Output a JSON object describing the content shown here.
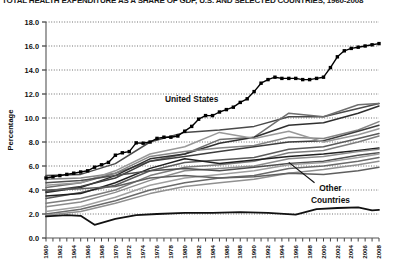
{
  "chart_data": {
    "type": "line",
    "title": "TOTAL HEALTH EXPENDITURE AS A SHARE OF GDP, U.S. AND SELECTED COUNTRIES, 1960-2008",
    "xlabel": "",
    "ylabel": "Percentage",
    "ylim": [
      0.0,
      18.0
    ],
    "ytick_step": 2.0,
    "yticks": [
      "0.0",
      "2.0",
      "4.0",
      "6.0",
      "8.0",
      "10.0",
      "12.0",
      "14.0",
      "16.0",
      "18.0"
    ],
    "xlim": [
      1960,
      2008
    ],
    "xticks": [
      "1960",
      "1962",
      "1964",
      "1966",
      "1968",
      "1970",
      "1972",
      "1974",
      "1976",
      "1978",
      "1980",
      "1982",
      "1984",
      "1986",
      "1988",
      "1990",
      "1992",
      "1994",
      "1996",
      "1998",
      "2000",
      "2002",
      "2004",
      "2006",
      "2008"
    ],
    "xtick_step": 2,
    "grid": "horizontal-dotted",
    "legend": "none",
    "annotations": [
      {
        "text": "United States",
        "x": 1981,
        "y": 11.3
      },
      {
        "text": "Other",
        "x": 2001,
        "y": 3.9
      },
      {
        "text": "Countries",
        "x": 2001,
        "y": 2.9
      }
    ],
    "series": [
      {
        "name": "United States",
        "emphasis": "marked",
        "color": "#000000",
        "marker": "square",
        "x": [
          1960,
          1961,
          1962,
          1963,
          1964,
          1965,
          1966,
          1967,
          1968,
          1969,
          1970,
          1971,
          1972,
          1973,
          1974,
          1975,
          1976,
          1977,
          1978,
          1979,
          1980,
          1981,
          1982,
          1983,
          1984,
          1985,
          1986,
          1987,
          1988,
          1989,
          1990,
          1991,
          1992,
          1993,
          1994,
          1995,
          1996,
          1997,
          1998,
          1999,
          2000,
          2001,
          2002,
          2003,
          2004,
          2005,
          2006,
          2007,
          2008
        ],
        "values": [
          5.0,
          5.1,
          5.2,
          5.3,
          5.4,
          5.5,
          5.6,
          5.9,
          6.1,
          6.3,
          6.9,
          7.1,
          7.2,
          7.927,
          7.9,
          8.0,
          8.3,
          8.4,
          8.4,
          8.5,
          8.9,
          9.3,
          9.9,
          10.2,
          10.2,
          10.5,
          10.7,
          10.9,
          11.3,
          11.6,
          12.2,
          12.9,
          13.2,
          13.4,
          13.3,
          13.3,
          13.3,
          13.2,
          13.2,
          13.3,
          13.4,
          14.2,
          15.1,
          15.6,
          15.8,
          15.9,
          16.0,
          16.1,
          16.2
        ]
      },
      {
        "name": "Other country A",
        "emphasis": "normal",
        "color": "#4a4a4a",
        "x": [
          1960,
          1965,
          1970,
          1975,
          1980,
          1985,
          1990,
          1995,
          2000,
          2005,
          2008
        ],
        "values": [
          5.2,
          5.3,
          6.2,
          8.0,
          8.8,
          9.0,
          9.3,
          10.1,
          10.1,
          10.8,
          11.2
        ]
      },
      {
        "name": "Other country B",
        "emphasis": "normal",
        "color": "#6e6e6e",
        "x": [
          1960,
          1965,
          1970,
          1975,
          1980,
          1985,
          1990,
          1995,
          2000,
          2005,
          2008
        ],
        "values": [
          4.2,
          4.6,
          5.4,
          6.4,
          7.0,
          8.2,
          8.4,
          10.4,
          10.1,
          11.1,
          11.2
        ]
      },
      {
        "name": "Other country C",
        "emphasis": "normal",
        "color": "#2f2f2f",
        "x": [
          1960,
          1965,
          1970,
          1975,
          1980,
          1985,
          1990,
          1995,
          2000,
          2005,
          2008
        ],
        "values": [
          3.8,
          4.2,
          5.2,
          6.6,
          7.0,
          7.9,
          8.4,
          9.4,
          9.6,
          10.4,
          11.0
        ]
      },
      {
        "name": "Other country D",
        "emphasis": "normal",
        "color": "#858585",
        "x": [
          1960,
          1965,
          1970,
          1975,
          1980,
          1985,
          1990,
          1995,
          2000,
          2005,
          2008
        ],
        "values": [
          4.9,
          5.0,
          5.4,
          6.8,
          7.2,
          7.5,
          7.7,
          8.4,
          8.3,
          9.0,
          9.7
        ]
      },
      {
        "name": "Other country E",
        "emphasis": "normal",
        "color": "#3d3d3d",
        "x": [
          1960,
          1965,
          1970,
          1975,
          1980,
          1985,
          1990,
          1995,
          2000,
          2005,
          2008
        ],
        "values": [
          3.9,
          4.3,
          5.0,
          6.4,
          6.8,
          7.2,
          7.6,
          8.0,
          8.1,
          8.9,
          9.4
        ]
      },
      {
        "name": "Other country F",
        "emphasis": "normal",
        "color": "#999999",
        "x": [
          1960,
          1965,
          1970,
          1975,
          1980,
          1985,
          1990,
          1995,
          2000,
          2005,
          2008
        ],
        "values": [
          4.4,
          4.6,
          5.6,
          7.0,
          7.6,
          8.8,
          8.3,
          8.9,
          8.0,
          8.6,
          9.1
        ]
      },
      {
        "name": "Other country G",
        "emphasis": "normal",
        "color": "#5a5a5a",
        "x": [
          1960,
          1965,
          1970,
          1975,
          1980,
          1985,
          1990,
          1995,
          2000,
          2005,
          2008
        ],
        "values": [
          3.3,
          3.8,
          4.4,
          5.6,
          6.3,
          6.5,
          6.7,
          7.4,
          7.6,
          8.3,
          8.7
        ]
      },
      {
        "name": "Other country H",
        "emphasis": "normal",
        "color": "#7d7d7d",
        "x": [
          1960,
          1965,
          1970,
          1975,
          1980,
          1985,
          1990,
          1995,
          2000,
          2005,
          2008
        ],
        "values": [
          2.9,
          3.3,
          4.0,
          5.2,
          5.9,
          6.1,
          6.4,
          7.1,
          7.3,
          8.0,
          8.5
        ]
      },
      {
        "name": "Other country I",
        "emphasis": "normal",
        "color": "#1f1f1f",
        "x": [
          1960,
          1965,
          1970,
          1975,
          1980,
          1985,
          1990,
          1995,
          2000,
          2005,
          2008
        ],
        "values": [
          3.5,
          3.7,
          4.6,
          5.8,
          6.6,
          6.2,
          6.5,
          6.8,
          7.0,
          7.3,
          7.5
        ]
      },
      {
        "name": "Other country J",
        "emphasis": "normal",
        "color": "#8c8c8c",
        "x": [
          1960,
          1965,
          1970,
          1975,
          1980,
          1985,
          1990,
          1995,
          2000,
          2005,
          2008
        ],
        "values": [
          2.6,
          3.0,
          3.8,
          4.8,
          5.6,
          5.8,
          6.0,
          6.6,
          6.8,
          7.2,
          7.4
        ]
      },
      {
        "name": "Other country K",
        "emphasis": "normal",
        "color": "#4f4f4f",
        "x": [
          1960,
          1965,
          1970,
          1975,
          1980,
          1985,
          1990,
          1995,
          2000,
          2005,
          2008
        ],
        "values": [
          4.6,
          4.8,
          5.2,
          5.6,
          5.8,
          5.6,
          5.9,
          6.2,
          6.4,
          6.9,
          7.1
        ]
      },
      {
        "name": "Other country L",
        "emphasis": "normal",
        "color": "#a0a0a0",
        "x": [
          1960,
          1965,
          1970,
          1975,
          1980,
          1985,
          1990,
          1995,
          2000,
          2005,
          2008
        ],
        "values": [
          2.2,
          2.6,
          3.4,
          4.4,
          5.0,
          5.3,
          5.6,
          6.1,
          6.3,
          6.7,
          7.0
        ]
      },
      {
        "name": "Other country M",
        "emphasis": "normal",
        "color": "#6a6a6a",
        "x": [
          1960,
          1965,
          1970,
          1975,
          1980,
          1985,
          1990,
          1995,
          2000,
          2005,
          2008
        ],
        "values": [
          2.0,
          2.4,
          3.1,
          4.0,
          4.6,
          5.0,
          5.2,
          5.8,
          6.0,
          6.4,
          6.7
        ]
      },
      {
        "name": "Other country N",
        "emphasis": "normal",
        "color": "#909090",
        "x": [
          1960,
          1965,
          1970,
          1975,
          1980,
          1985,
          1990,
          1995,
          2000,
          2005,
          2008
        ],
        "values": [
          1.9,
          2.2,
          2.9,
          3.7,
          4.3,
          4.6,
          4.9,
          5.4,
          5.7,
          6.1,
          6.4
        ]
      },
      {
        "name": "Other country O",
        "emphasis": "normal",
        "color": "#5f5f5f",
        "x": [
          1960,
          1965,
          1970,
          1975,
          1980,
          1985,
          1990,
          1995,
          2000,
          2005,
          2008
        ],
        "values": [
          4.0,
          4.1,
          4.3,
          5.0,
          5.2,
          5.0,
          5.1,
          5.4,
          5.3,
          5.6,
          5.9
        ]
      },
      {
        "name": "Other country P (lowest)",
        "emphasis": "normal",
        "color": "#111111",
        "x": [
          1960,
          1963,
          1965,
          1967,
          1970,
          1973,
          1976,
          1980,
          1984,
          1988,
          1992,
          1996,
          1999,
          2002,
          2005,
          2007,
          2008
        ],
        "values": [
          1.8,
          1.9,
          1.85,
          1.1,
          1.6,
          1.9,
          2.0,
          2.1,
          2.1,
          2.15,
          2.1,
          1.95,
          2.4,
          2.5,
          2.55,
          2.3,
          2.35
        ]
      }
    ]
  }
}
